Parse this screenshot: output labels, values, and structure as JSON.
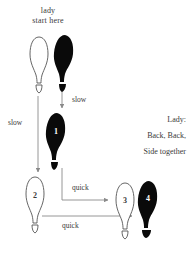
{
  "canvas": {
    "width": 192,
    "height": 256,
    "background": "#ffffff"
  },
  "header": {
    "line1": "lady",
    "line2": "start here"
  },
  "caption": {
    "line1": "Lady:",
    "line2": "Back, Back,",
    "line3": "Side together"
  },
  "arrows": [
    {
      "id": "slow-left",
      "label": "slow",
      "direction": "down",
      "from": "start-left-foot",
      "to": "footprint-2"
    },
    {
      "id": "slow-right",
      "label": "slow",
      "direction": "down",
      "from": "start-right-foot",
      "to": "footprint-1"
    },
    {
      "id": "quick-upper",
      "label": "quick",
      "direction": "right",
      "from": "footprint-1",
      "to": "footprint-3"
    },
    {
      "id": "quick-lower",
      "label": "quick",
      "direction": "right",
      "from": "footprint-2",
      "to": "footprint-4"
    }
  ],
  "footprints": [
    {
      "id": "start-left-foot",
      "number": "",
      "fill": "outline",
      "foot": "left",
      "x": 28,
      "y": 36
    },
    {
      "id": "start-right-foot",
      "number": "",
      "fill": "solid",
      "foot": "right",
      "x": 52,
      "y": 34
    },
    {
      "id": "footprint-1",
      "number": "1",
      "fill": "solid",
      "foot": "right",
      "x": 43,
      "y": 112
    },
    {
      "id": "footprint-2",
      "number": "2",
      "fill": "outline",
      "foot": "left",
      "x": 23,
      "y": 176
    },
    {
      "id": "footprint-3",
      "number": "3",
      "fill": "outline",
      "foot": "left",
      "x": 114,
      "y": 182
    },
    {
      "id": "footprint-4",
      "number": "4",
      "fill": "solid",
      "foot": "right",
      "x": 136,
      "y": 180
    }
  ],
  "colors": {
    "ink": "#3a3a3a",
    "solid_foot": "#0a0a0a",
    "outline_foot": "#ffffff",
    "outline_stroke": "#555555",
    "arrow": "#8a8a8a",
    "background": "#ffffff"
  }
}
